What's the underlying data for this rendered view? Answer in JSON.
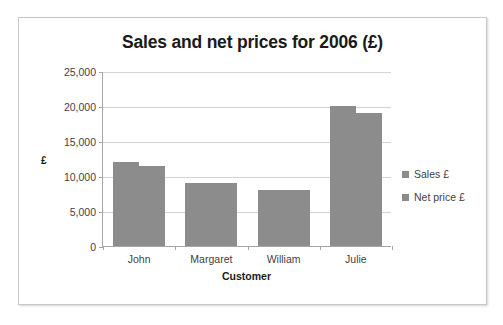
{
  "chart_data": {
    "type": "bar",
    "title": "Sales and net prices for 2006 (£)",
    "xlabel": "Customer",
    "ylabel": "£",
    "categories": [
      "John",
      "Margaret",
      "William",
      "Julie"
    ],
    "series": [
      {
        "name": "Sales £",
        "values": [
          12000,
          9000,
          8000,
          20000
        ],
        "color": "#8c8c8c"
      },
      {
        "name": "Net price £",
        "values": [
          11500,
          9000,
          8000,
          19000
        ],
        "color": "#8c8c8c"
      }
    ],
    "ylim": [
      0,
      25000
    ],
    "ytick_values": [
      0,
      5000,
      10000,
      15000,
      20000,
      25000
    ],
    "ytick_labels": [
      "0",
      "5,000",
      "10,000",
      "15,000",
      "20,000",
      "25,000"
    ],
    "grid": "horizontal",
    "legend_position": "right",
    "bar_gap_within_group": 0
  },
  "legend": {
    "items": [
      {
        "label": "Sales £",
        "color": "#8c8c8c"
      },
      {
        "label": "Net price £",
        "color": "#8c8c8c"
      }
    ]
  }
}
